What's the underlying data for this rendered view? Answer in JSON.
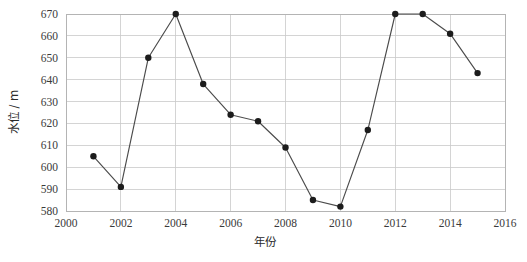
{
  "chart_data": {
    "type": "line",
    "title": "",
    "subtitle": "",
    "xlabel": "年份",
    "ylabel": "水位 / m",
    "xlim": [
      2000,
      2016
    ],
    "ylim": [
      580,
      670
    ],
    "xticks": [
      2000,
      2002,
      2004,
      2006,
      2008,
      2010,
      2012,
      2014,
      2016
    ],
    "xtick_labels": [
      "2000",
      "2002",
      "2004",
      "2006",
      "2008",
      "2010",
      "2012",
      "2014",
      "2016"
    ],
    "yticks": [
      580,
      590,
      600,
      610,
      620,
      630,
      640,
      650,
      660,
      670
    ],
    "ytick_labels": [
      "580",
      "590",
      "600",
      "610",
      "620",
      "630",
      "640",
      "650",
      "660",
      "670"
    ],
    "grid": true,
    "grid_axis": "both",
    "legend": false,
    "legend_position": "none",
    "marker": "circle",
    "line_color": "#4b4b4b",
    "marker_color": "#1c1c1c",
    "grid_color": "#c9c9c9",
    "frame_color": "#b4b4b4",
    "background_color": "#ffffff",
    "x": [
      2001,
      2002,
      2003,
      2004,
      2005,
      2006,
      2007,
      2008,
      2009,
      2010,
      2011,
      2012,
      2013,
      2014,
      2015
    ],
    "values": [
      605,
      591,
      650,
      670,
      638,
      624,
      621,
      609,
      585,
      582,
      617,
      670,
      670,
      661,
      643
    ],
    "series": [
      {
        "name": "水位",
        "x": [
          2001,
          2002,
          2003,
          2004,
          2005,
          2006,
          2007,
          2008,
          2009,
          2010,
          2011,
          2012,
          2013,
          2014,
          2015
        ],
        "values": [
          605,
          591,
          650,
          670,
          638,
          624,
          621,
          609,
          585,
          582,
          617,
          670,
          670,
          661,
          643
        ]
      }
    ],
    "points": [
      {
        "year": "2001",
        "level": 605
      },
      {
        "year": "2002",
        "level": 591
      },
      {
        "year": "2003",
        "level": 650
      },
      {
        "year": "2004",
        "level": 670
      },
      {
        "year": "2005",
        "level": 638
      },
      {
        "year": "2006",
        "level": 624
      },
      {
        "year": "2007",
        "level": 621
      },
      {
        "year": "2008",
        "level": 609
      },
      {
        "year": "2009",
        "level": 585
      },
      {
        "year": "2010",
        "level": 582
      },
      {
        "year": "2011",
        "level": 617
      },
      {
        "year": "2012",
        "level": 670
      },
      {
        "year": "2013",
        "level": 670
      },
      {
        "year": "2014",
        "level": 661
      },
      {
        "year": "2015",
        "level": 643
      }
    ]
  }
}
